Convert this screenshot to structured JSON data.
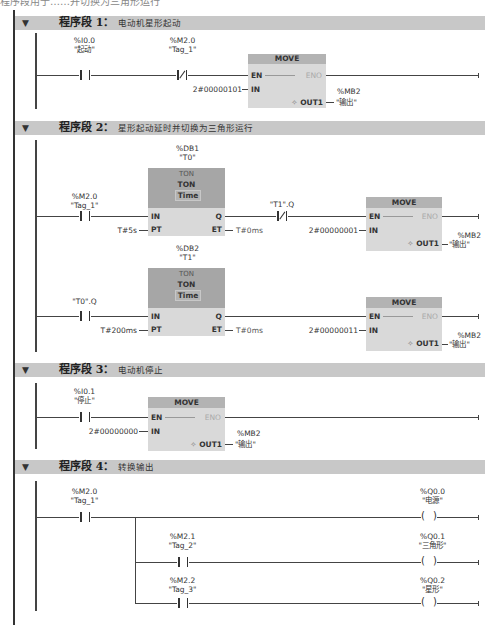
{
  "top_cutoff_text": "程序段用于……并切换为三角形运行",
  "networks": [
    {
      "header": {
        "title": "程序段 1：",
        "comment": "电动机星形起动",
        "collapse_icon": "triangle-down"
      },
      "contacts": [
        {
          "address": "%I0.0",
          "name": "\"起动\"",
          "type": "NO"
        },
        {
          "address": "%M2.0",
          "name": "\"Tag_1\"",
          "type": "NC"
        }
      ],
      "move": {
        "title": "MOVE",
        "en": "EN",
        "eno": "ENO",
        "in_label": "IN",
        "out_label": "OUT1",
        "out_icon": "✧",
        "in_value": "2#00000101",
        "out_address": "%MB2",
        "out_name": "\"输出\""
      }
    },
    {
      "header": {
        "title": "程序段 2：",
        "comment": "星形起动延时并切换为三角形运行",
        "collapse_icon": "triangle-down"
      },
      "rung1": {
        "contact": {
          "address": "%M2.0",
          "name": "\"Tag_1\"",
          "type": "NO"
        },
        "timer": {
          "db": "%DB1",
          "instance": "\"T0\"",
          "type_top": "TON",
          "type": "TON",
          "data_type": "Time",
          "in": "IN",
          "q": "Q",
          "pt": "PT",
          "et": "ET",
          "pt_value": "T#5s",
          "et_value": "T#0ms"
        },
        "contact2": {
          "name": "\"T1\".Q",
          "type": "NC"
        },
        "move": {
          "title": "MOVE",
          "en": "EN",
          "eno": "ENO",
          "in_label": "IN",
          "out_label": "OUT1",
          "out_icon": "✧",
          "in_value": "2#00000001",
          "out_address": "%MB2",
          "out_name": "\"输出\""
        }
      },
      "rung2": {
        "contact": {
          "name": "\"T0\".Q",
          "type": "NO"
        },
        "timer": {
          "db": "%DB2",
          "instance": "\"T1\"",
          "type_top": "TON",
          "type": "TON",
          "data_type": "Time",
          "in": "IN",
          "q": "Q",
          "pt": "PT",
          "et": "ET",
          "pt_value": "T#200ms",
          "et_value": "T#0ms"
        },
        "move": {
          "title": "MOVE",
          "en": "EN",
          "eno": "ENO",
          "in_label": "IN",
          "out_label": "OUT1",
          "out_icon": "✧",
          "in_value": "2#00000011",
          "out_address": "%MB2",
          "out_name": "\"输出\""
        }
      }
    },
    {
      "header": {
        "title": "程序段 3：",
        "comment": "电动机停止",
        "collapse_icon": "triangle-down"
      },
      "contact": {
        "address": "%I0.1",
        "name": "\"停止\"",
        "type": "NO"
      },
      "move": {
        "title": "MOVE",
        "en": "EN",
        "eno": "ENO",
        "in_label": "IN",
        "out_label": "OUT1",
        "out_icon": "✧",
        "in_value": "2#00000000",
        "out_address": "%MB2",
        "out_name": "\"输出\""
      }
    },
    {
      "header": {
        "title": "程序段 4：",
        "comment": "转换输出",
        "collapse_icon": "triangle-down"
      },
      "main_contact": {
        "address": "%M2.0",
        "name": "\"Tag_1\"",
        "type": "NO"
      },
      "branches": [
        {
          "contact": null,
          "coil": {
            "address": "%Q0.0",
            "name": "\"电源\""
          }
        },
        {
          "contact": {
            "address": "%M2.1",
            "name": "\"Tag_2\"",
            "type": "NO"
          },
          "coil": {
            "address": "%Q0.1",
            "name": "\"三角形\""
          }
        },
        {
          "contact": {
            "address": "%M2.2",
            "name": "\"Tag_3\"",
            "type": "NO"
          },
          "coil": {
            "address": "%Q0.2",
            "name": "\"星形\""
          }
        }
      ]
    }
  ],
  "colors": {
    "header_bg": "#c8c8c8",
    "block_body": "#d9d9d9",
    "block_head": "#b3b3b3",
    "timer_head": "#a6a6a6",
    "wire": "#444444"
  }
}
